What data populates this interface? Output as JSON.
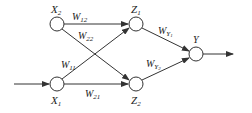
{
  "diagram": {
    "type": "neural-network",
    "nodes": [
      {
        "id": "X2",
        "label": "X",
        "sub": "2",
        "cx": 57,
        "cy": 24
      },
      {
        "id": "X1",
        "label": "X",
        "sub": "1",
        "cx": 57,
        "cy": 84
      },
      {
        "id": "Z1",
        "label": "Z",
        "sub": "1",
        "cx": 136,
        "cy": 24
      },
      {
        "id": "Z2",
        "label": "Z",
        "sub": "2",
        "cx": 136,
        "cy": 84
      },
      {
        "id": "Y",
        "label": "Y",
        "sub": "",
        "cx": 196,
        "cy": 54
      }
    ],
    "edges": [
      {
        "from": "X2",
        "to": "Z1",
        "label": "W",
        "sub": "12"
      },
      {
        "from": "X2",
        "to": "Z2",
        "label": "W",
        "sub": "22"
      },
      {
        "from": "X1",
        "to": "Z1",
        "label": "W",
        "sub": "11"
      },
      {
        "from": "X1",
        "to": "Z2",
        "label": "W",
        "sub": "21"
      },
      {
        "from": "Z1",
        "to": "Y",
        "label": "W",
        "sub": "Y",
        "subsub": "1"
      },
      {
        "from": "Z2",
        "to": "Y",
        "label": "W",
        "sub": "Y",
        "subsub": "2"
      }
    ],
    "input_arrow": {
      "to": "X1"
    },
    "output_arrow": {
      "from": "Y"
    },
    "colors": {
      "stroke": "#333333",
      "background": "#ffffff"
    }
  }
}
